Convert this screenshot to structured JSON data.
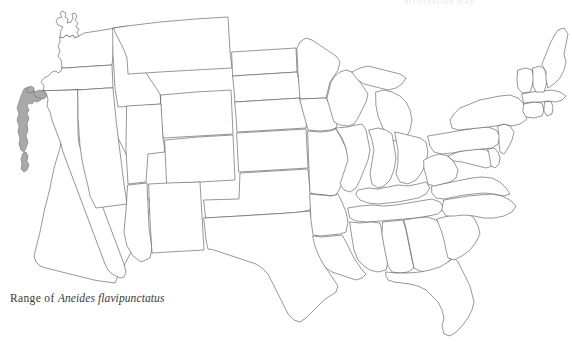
{
  "figure": {
    "caption_lead": "Range of",
    "caption_species": "Aneides flavipunctatus",
    "clipped_header": "distribution map",
    "background_color": "#ffffff",
    "outline_color": "#55585c",
    "range_fill_color": "#a9a9a9",
    "range_stroke_color": "#6d6d6d",
    "caption_color": "#3a3a3a"
  },
  "map": {
    "region": "contiguous-united-states",
    "projection_note": "state-boundary outline map",
    "range_label": "Aneides flavipunctatus range",
    "range_area_description": "northern California coast ranges from the Oregon border south to the San Francisco Bay area",
    "states": [
      "Washington",
      "Oregon",
      "California",
      "Nevada",
      "Idaho",
      "Montana",
      "Wyoming",
      "Utah",
      "Arizona",
      "Colorado",
      "New Mexico",
      "North Dakota",
      "South Dakota",
      "Nebraska",
      "Kansas",
      "Oklahoma",
      "Texas",
      "Minnesota",
      "Iowa",
      "Missouri",
      "Arkansas",
      "Louisiana",
      "Wisconsin",
      "Illinois",
      "Michigan",
      "Indiana",
      "Ohio",
      "Kentucky",
      "Tennessee",
      "Mississippi",
      "Alabama",
      "Georgia",
      "Florida",
      "South Carolina",
      "North Carolina",
      "Virginia",
      "West Virginia",
      "Maryland",
      "Delaware",
      "Pennsylvania",
      "New Jersey",
      "New York",
      "Connecticut",
      "Rhode Island",
      "Massachusetts",
      "Vermont",
      "New Hampshire",
      "Maine"
    ]
  }
}
